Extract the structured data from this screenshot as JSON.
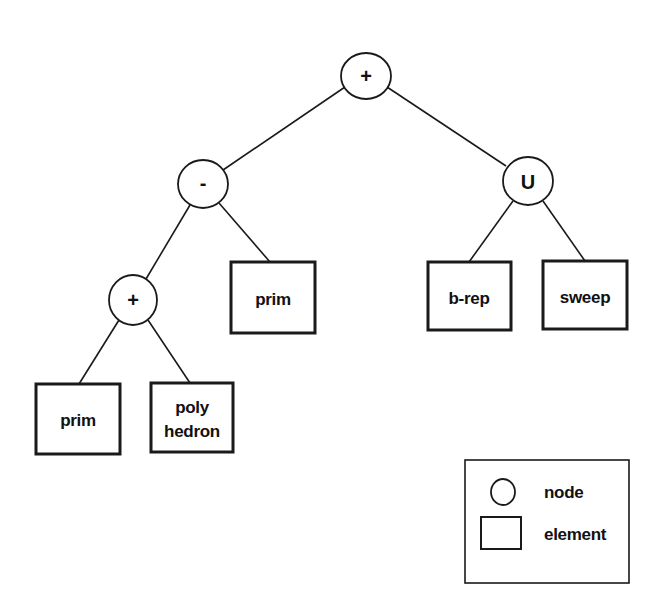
{
  "diagram": {
    "type": "tree",
    "nodes": {
      "root": {
        "label": "+",
        "kind": "node"
      },
      "minus": {
        "label": "-",
        "kind": "node"
      },
      "union": {
        "label": "U",
        "kind": "node"
      },
      "plus_lower": {
        "label": "+",
        "kind": "node"
      }
    },
    "elements": {
      "prim_mid": {
        "label": "prim",
        "kind": "element"
      },
      "brep": {
        "label": "b-rep",
        "kind": "element"
      },
      "sweep": {
        "label": "sweep",
        "kind": "element"
      },
      "prim_low": {
        "label": "prim",
        "kind": "element"
      },
      "polyhedron": {
        "line1": "poly",
        "line2": "hedron",
        "kind": "element"
      }
    },
    "edges": [
      {
        "from": "root",
        "to": "minus"
      },
      {
        "from": "root",
        "to": "union"
      },
      {
        "from": "minus",
        "to": "plus_lower"
      },
      {
        "from": "minus",
        "to": "prim_mid"
      },
      {
        "from": "union",
        "to": "brep"
      },
      {
        "from": "union",
        "to": "sweep"
      },
      {
        "from": "plus_lower",
        "to": "prim_low"
      },
      {
        "from": "plus_lower",
        "to": "polyhedron"
      }
    ]
  },
  "legend": {
    "node_label": "node",
    "element_label": "element"
  },
  "colors": {
    "stroke": "#1a1a1a",
    "background": "#ffffff",
    "text": "#111111"
  }
}
